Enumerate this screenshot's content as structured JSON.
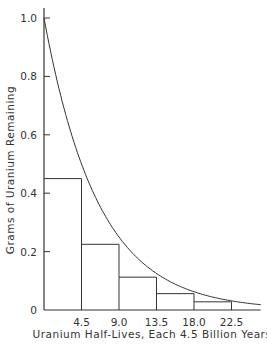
{
  "chart_data": {
    "type": "line",
    "title": "",
    "xlabel": "Uranium Half-Lives, Each 4.5 Billion Years",
    "ylabel": "Grams of Uranium Remaining",
    "x_ticks": [
      "4.5",
      "9.0",
      "13.5",
      "18.0",
      "22.5"
    ],
    "x_tick_values": [
      4.5,
      9.0,
      13.5,
      18.0,
      22.5
    ],
    "y_ticks": [
      "0",
      "0.2",
      "0.4",
      "0.6",
      "0.8",
      "1.0"
    ],
    "y_tick_values": [
      0,
      0.2,
      0.4,
      0.6,
      0.8,
      1.0
    ],
    "xlim": [
      0,
      26
    ],
    "ylim": [
      0,
      1.0
    ],
    "grid": false,
    "series": [
      {
        "name": "decay curve",
        "x": [
          0,
          4.5,
          9.0,
          13.5,
          18.0,
          22.5,
          26
        ],
        "values": [
          1.0,
          0.5,
          0.25,
          0.125,
          0.0625,
          0.03125,
          0.018
        ]
      },
      {
        "name": "step rectangles",
        "type": "bar",
        "x": [
          4.5,
          9.0,
          13.5,
          18.0,
          22.5
        ],
        "values": [
          0.45,
          0.225,
          0.1125,
          0.056,
          0.028
        ]
      }
    ]
  }
}
